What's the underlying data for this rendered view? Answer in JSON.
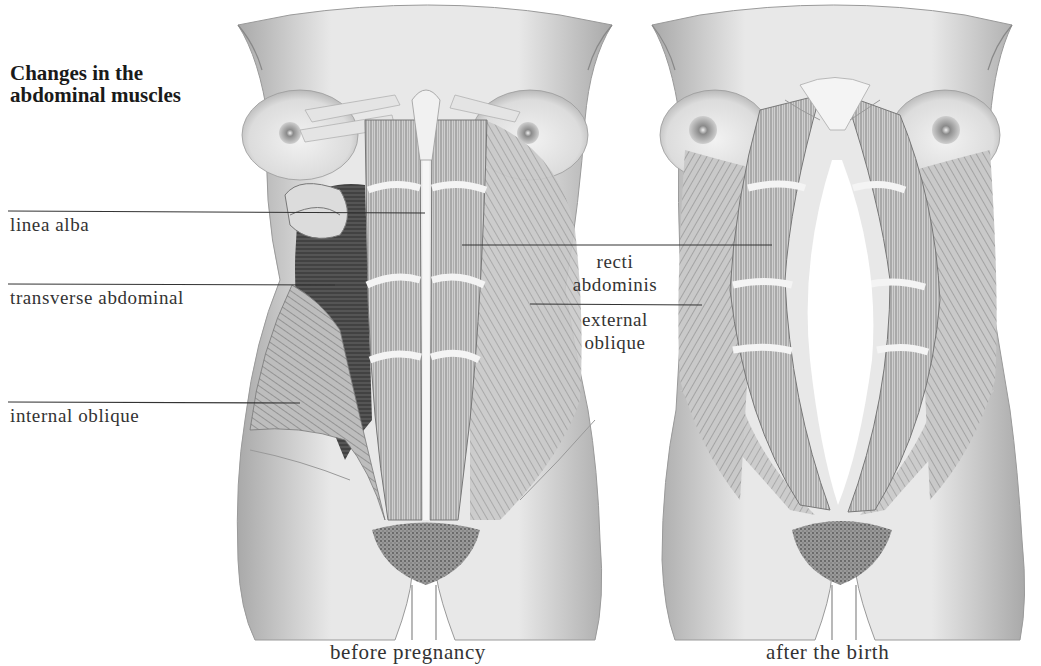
{
  "title": {
    "line1": "Changes in the",
    "line2": "abdominal muscles"
  },
  "labels": {
    "linea_alba": "linea alba",
    "transverse_abdominal": "transverse abdominal",
    "internal_oblique": "internal oblique",
    "recti_abdominis_line1": "recti",
    "recti_abdominis_line2": "abdominis",
    "external_oblique_line1": "external",
    "external_oblique_line2": "oblique"
  },
  "captions": {
    "before": "before pregnancy",
    "after": "after the birth"
  },
  "colors": {
    "background": "#ffffff",
    "skin": "#e9e9e9",
    "muscle": "#a8a8a8",
    "muscle_dark": "#5a5a5a",
    "ink": "#2a2a2a"
  }
}
